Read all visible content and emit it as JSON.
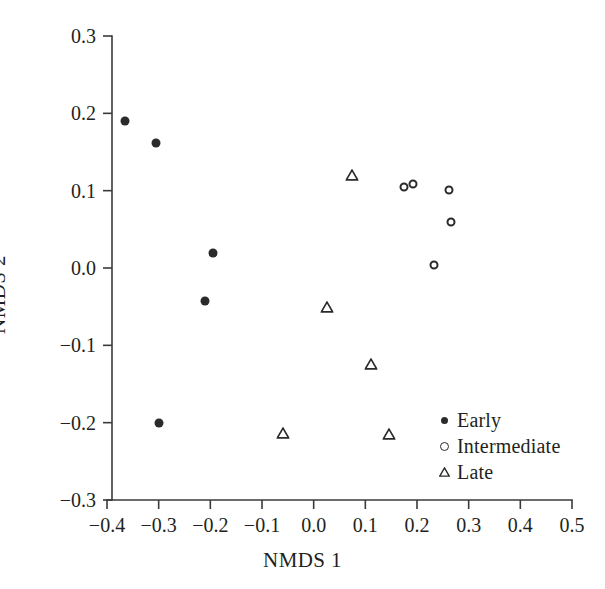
{
  "chart_data": {
    "type": "scatter",
    "title": "",
    "xlabel": "NMDS 1",
    "ylabel": "NMDS 2",
    "xlim": [
      -0.4,
      0.5
    ],
    "ylim": [
      -0.3,
      0.3
    ],
    "xticks": [
      -0.4,
      -0.3,
      -0.2,
      -0.1,
      0.0,
      0.1,
      0.2,
      0.3,
      0.4,
      0.5
    ],
    "xticklabels": [
      "−0.4",
      "−0.3",
      "−0.2",
      "−0.1",
      "0.0",
      "0.1",
      "0.2",
      "0.3",
      "0.4",
      "0.5"
    ],
    "yticks": [
      -0.3,
      -0.2,
      -0.1,
      0.0,
      0.1,
      0.2,
      0.3
    ],
    "yticklabels": [
      "−0.3",
      "−0.2",
      "−0.1",
      "0.0",
      "0.1",
      "0.2",
      "0.3"
    ],
    "grid": false,
    "legend_position": "lower-right",
    "marker_color": "#2b2b2b",
    "series": [
      {
        "name": "Early",
        "marker": "filled-circle",
        "color": "#2b2b2b",
        "points": [
          {
            "x": -0.365,
            "y": 0.19
          },
          {
            "x": -0.305,
            "y": 0.162
          },
          {
            "x": -0.195,
            "y": 0.02
          },
          {
            "x": -0.21,
            "y": -0.043
          },
          {
            "x": -0.3,
            "y": -0.201
          }
        ]
      },
      {
        "name": "Intermediate",
        "marker": "open-circle",
        "color": "#2b2b2b",
        "points": [
          {
            "x": 0.175,
            "y": 0.105
          },
          {
            "x": 0.192,
            "y": 0.109
          },
          {
            "x": 0.262,
            "y": 0.101
          },
          {
            "x": 0.265,
            "y": 0.059
          },
          {
            "x": 0.232,
            "y": 0.004
          }
        ]
      },
      {
        "name": "Late",
        "marker": "triangle",
        "color": "#2b2b2b",
        "points": [
          {
            "x": 0.075,
            "y": 0.12
          },
          {
            "x": 0.025,
            "y": -0.051
          },
          {
            "x": 0.11,
            "y": -0.124
          },
          {
            "x": -0.06,
            "y": -0.213
          },
          {
            "x": 0.145,
            "y": -0.215
          }
        ]
      }
    ]
  },
  "legend": {
    "entries": [
      {
        "label": "Early",
        "marker": "filled-circle"
      },
      {
        "label": "Intermediate",
        "marker": "open-circle"
      },
      {
        "label": "Late",
        "marker": "triangle"
      }
    ]
  },
  "axes": {
    "x_title": "NMDS 1",
    "y_title": "NMDS 2",
    "axis_color": "#3a3a3a"
  }
}
